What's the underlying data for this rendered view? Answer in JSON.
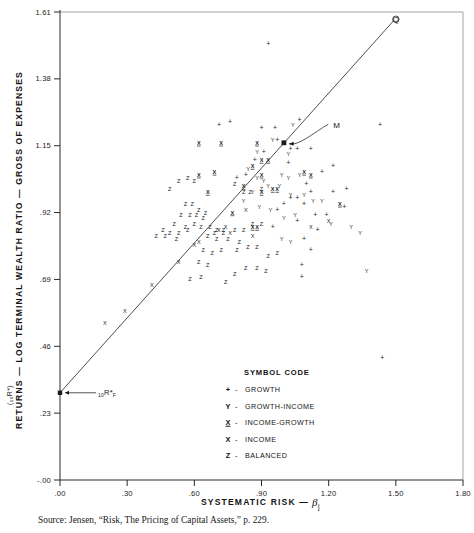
{
  "figure": {
    "source_note": "Source: Jensen, “Risk, The Pricing of Capital Assets,” p. 229."
  },
  "chart_data": {
    "type": "scatter",
    "title": "",
    "xlabel": "SYSTEMATIC RISK — β",
    "ylabel": "RETURNS — LOG TERMINAL WEALTH RATIO — GROSS OF EXPENSES",
    "ylabel_sub": "(₁₀R*)",
    "xlim": [
      0.0,
      1.8
    ],
    "ylim": [
      0.0,
      1.61
    ],
    "grid": false,
    "legend_position": "inside-bottom-center",
    "xticks": [
      ".00",
      ".30",
      ".60",
      ".90",
      "1.20",
      "1.50",
      "1.80"
    ],
    "xtick_values": [
      0.0,
      0.3,
      0.6,
      0.9,
      1.2,
      1.5,
      1.8
    ],
    "yticks": [
      "-.00",
      ".23",
      ".46",
      ".69",
      ".92",
      "1.15",
      "1.38",
      "1.61"
    ],
    "ytick_values": [
      0.0,
      0.23,
      0.46,
      0.69,
      0.92,
      1.15,
      1.38,
      1.61
    ],
    "regression_line": {
      "x0": 0.0,
      "y0": 0.3,
      "x1": 1.49,
      "y1": 1.58
    },
    "annotations": [
      {
        "name": "risk-free-rate",
        "label": "₁₀R*_F",
        "x": 0.0,
        "y": 0.3,
        "label_x": 0.17,
        "label_y": 0.3
      },
      {
        "name": "market-portfolio",
        "label": "M",
        "x": 1.0,
        "y": 1.16,
        "label_x": 1.22,
        "label_y": 1.22
      },
      {
        "name": "q-point",
        "label": "Q",
        "x": 1.5,
        "y": 1.585
      }
    ],
    "legend": {
      "title": "SYMBOL CODE",
      "entries": [
        {
          "symbol": "+",
          "name": "growth",
          "label": "GROWTH"
        },
        {
          "symbol": "Y",
          "name": "growth-income",
          "label": "GROWTH-INCOME"
        },
        {
          "symbol": "X̲",
          "name": "income-growth",
          "label": "INCOME-GROWTH"
        },
        {
          "symbol": "X",
          "name": "income",
          "label": "INCOME"
        },
        {
          "symbol": "Z",
          "name": "balanced",
          "label": "BALANCED"
        }
      ]
    },
    "series": [
      {
        "name": "GROWTH",
        "symbol": "+",
        "points": [
          [
            0.93,
            1.5
          ],
          [
            1.07,
            1.24
          ],
          [
            1.43,
            1.22
          ],
          [
            1.0,
            1.16
          ],
          [
            1.03,
            1.14
          ],
          [
            0.9,
            1.21
          ],
          [
            0.96,
            1.21
          ],
          [
            0.97,
            1.17
          ],
          [
            1.06,
            1.14
          ],
          [
            1.12,
            1.14
          ],
          [
            1.02,
            1.09
          ],
          [
            1.1,
            1.02
          ],
          [
            1.17,
            1.06
          ],
          [
            1.22,
            1.08
          ],
          [
            1.12,
            0.99
          ],
          [
            1.22,
            0.99
          ],
          [
            1.28,
            1.0
          ],
          [
            1.03,
            0.97
          ],
          [
            1.06,
            0.97
          ],
          [
            1.09,
            0.95
          ],
          [
            1.0,
            0.95
          ],
          [
            0.97,
            0.93
          ],
          [
            1.06,
            0.89
          ],
          [
            1.14,
            0.91
          ],
          [
            1.19,
            0.91
          ],
          [
            1.27,
            0.94
          ],
          [
            0.95,
            0.87
          ],
          [
            1.09,
            0.83
          ],
          [
            1.15,
            0.86
          ],
          [
            1.12,
            0.79
          ],
          [
            1.08,
            0.74
          ],
          [
            1.08,
            0.7
          ],
          [
            1.44,
            0.42
          ],
          [
            0.91,
            1.13
          ],
          [
            0.87,
            1.1
          ],
          [
            0.83,
            1.05
          ],
          [
            0.79,
            1.04
          ],
          [
            0.76,
            1.23
          ],
          [
            0.71,
            1.22
          ]
        ]
      },
      {
        "name": "GROWTH-INCOME",
        "symbol": "Y",
        "points": [
          [
            1.04,
            1.22
          ],
          [
            0.95,
            1.17
          ],
          [
            0.84,
            1.07
          ],
          [
            0.88,
            1.04
          ],
          [
            0.91,
            1.03
          ],
          [
            0.99,
            1.05
          ],
          [
            1.02,
            1.04
          ],
          [
            1.07,
            1.05
          ],
          [
            1.02,
            1.12
          ],
          [
            0.93,
            1.01
          ],
          [
            0.98,
            1.01
          ],
          [
            1.03,
            0.98
          ],
          [
            1.09,
            0.98
          ],
          [
            1.13,
            0.96
          ],
          [
            1.17,
            0.96
          ],
          [
            0.86,
            0.99
          ],
          [
            0.82,
            0.96
          ],
          [
            0.89,
            0.94
          ],
          [
            0.94,
            0.93
          ],
          [
            1.0,
            0.9
          ],
          [
            1.05,
            0.91
          ],
          [
            1.21,
            0.88
          ],
          [
            1.3,
            0.87
          ],
          [
            1.34,
            0.85
          ],
          [
            0.99,
            0.83
          ],
          [
            1.03,
            0.82
          ],
          [
            0.88,
            1.13
          ],
          [
            1.37,
            0.72
          ]
        ]
      },
      {
        "name": "INCOME-GROWTH",
        "symbol": "X̲",
        "points": [
          [
            0.62,
            1.16
          ],
          [
            0.72,
            1.16
          ],
          [
            0.88,
            1.16
          ],
          [
            0.62,
            1.05
          ],
          [
            0.69,
            1.06
          ],
          [
            0.66,
            0.99
          ],
          [
            0.9,
            1.1
          ],
          [
            0.93,
            1.1
          ],
          [
            0.86,
            1.08
          ],
          [
            0.9,
            1.05
          ],
          [
            1.09,
            1.06
          ],
          [
            1.12,
            1.05
          ],
          [
            0.95,
            1.0
          ],
          [
            0.97,
            1.0
          ],
          [
            0.9,
            0.99
          ],
          [
            0.82,
            1.01
          ],
          [
            0.77,
            0.92
          ],
          [
            0.86,
            0.87
          ],
          [
            0.88,
            0.87
          ],
          [
            1.25,
            0.95
          ]
        ]
      },
      {
        "name": "INCOME",
        "symbol": "X",
        "points": [
          [
            0.2,
            0.54
          ],
          [
            0.29,
            0.58
          ],
          [
            0.41,
            0.67
          ],
          [
            0.53,
            0.75
          ],
          [
            0.62,
            0.82
          ],
          [
            0.71,
            0.86
          ],
          [
            0.74,
            0.87
          ],
          [
            0.6,
            0.81
          ],
          [
            0.83,
            0.93
          ],
          [
            1.12,
            0.87
          ],
          [
            1.2,
            0.89
          ],
          [
            0.86,
            0.84
          ],
          [
            0.76,
            0.85
          ]
        ]
      },
      {
        "name": "BALANCED",
        "symbol": "Z",
        "points": [
          [
            0.53,
            1.03
          ],
          [
            0.57,
            1.04
          ],
          [
            0.6,
            1.03
          ],
          [
            0.49,
            1.0
          ],
          [
            0.78,
            1.02
          ],
          [
            0.82,
            0.99
          ],
          [
            0.85,
            0.99
          ],
          [
            0.9,
            1.0
          ],
          [
            0.56,
            0.95
          ],
          [
            0.59,
            0.95
          ],
          [
            0.62,
            0.93
          ],
          [
            0.65,
            0.92
          ],
          [
            0.54,
            0.91
          ],
          [
            0.58,
            0.91
          ],
          [
            0.61,
            0.91
          ],
          [
            0.64,
            0.9
          ],
          [
            0.51,
            0.88
          ],
          [
            0.56,
            0.87
          ],
          [
            0.6,
            0.88
          ],
          [
            0.63,
            0.87
          ],
          [
            0.67,
            0.87
          ],
          [
            0.7,
            0.86
          ],
          [
            0.73,
            0.86
          ],
          [
            0.46,
            0.86
          ],
          [
            0.49,
            0.85
          ],
          [
            0.53,
            0.85
          ],
          [
            0.57,
            0.86
          ],
          [
            0.43,
            0.84
          ],
          [
            0.47,
            0.84
          ],
          [
            0.52,
            0.83
          ],
          [
            0.69,
            0.85
          ],
          [
            0.73,
            0.85
          ],
          [
            0.78,
            0.86
          ],
          [
            0.82,
            0.86
          ],
          [
            0.86,
            0.88
          ],
          [
            0.9,
            0.88
          ],
          [
            0.66,
            0.84
          ],
          [
            0.7,
            0.83
          ],
          [
            0.75,
            0.83
          ],
          [
            0.8,
            0.82
          ],
          [
            0.64,
            0.79
          ],
          [
            0.68,
            0.78
          ],
          [
            0.72,
            0.79
          ],
          [
            0.79,
            0.79
          ],
          [
            0.84,
            0.8
          ],
          [
            0.88,
            0.8
          ],
          [
            0.62,
            0.75
          ],
          [
            0.66,
            0.74
          ],
          [
            0.93,
            0.77
          ],
          [
            0.97,
            0.78
          ],
          [
            0.83,
            0.73
          ],
          [
            0.88,
            0.73
          ],
          [
            0.92,
            0.72
          ],
          [
            0.78,
            0.71
          ],
          [
            0.74,
            0.68
          ],
          [
            0.63,
            0.7
          ],
          [
            0.58,
            0.69
          ]
        ]
      }
    ]
  }
}
